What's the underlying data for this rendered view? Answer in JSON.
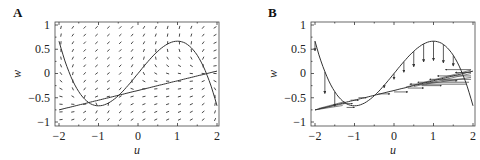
{
  "chart_data": [
    {
      "panel": "A",
      "type": "line",
      "description": "Phase plane with direction field (vector field arrows), cubic nullcline and linear nullcline",
      "xlabel": "u",
      "ylabel": "w",
      "xlim": [
        -2,
        2
      ],
      "ylim": [
        -1,
        1
      ],
      "xticks": [
        "-2",
        "-1",
        "0",
        "1",
        "2"
      ],
      "yticks": [
        "1",
        "0.5",
        "0",
        "-0.5",
        "-1"
      ],
      "series": [
        {
          "name": "cubic nullcline",
          "formula": "w = u - u^3/3",
          "x": [
            -2,
            -1.5,
            -1,
            -0.5,
            0,
            0.5,
            1,
            1.5,
            2
          ],
          "y": [
            0.67,
            -0.38,
            -0.67,
            -0.46,
            0,
            0.46,
            0.67,
            0.38,
            -0.67
          ]
        },
        {
          "name": "linear nullcline",
          "formula": "w = 0.2u - 0.35",
          "x": [
            -2,
            2
          ],
          "y": [
            -0.75,
            0.05
          ]
        }
      ],
      "vector_field": {
        "grid_u": 14,
        "grid_w": 13
      }
    },
    {
      "panel": "B",
      "type": "line",
      "description": "Nullclines with sample trajectory arrows",
      "xlabel": "u",
      "ylabel": "w",
      "xlim": [
        -2,
        2
      ],
      "ylim": [
        -1,
        1
      ],
      "xticks": [
        "-2",
        "-1",
        "0",
        "1",
        "2"
      ],
      "yticks": [
        "1",
        "0.5",
        "0",
        "-0.5",
        "-1"
      ],
      "series": [
        {
          "name": "cubic nullcline",
          "formula": "w = u - u^3/3",
          "x": [
            -2,
            -1.5,
            -1,
            -0.5,
            0,
            0.5,
            1,
            1.5,
            2
          ],
          "y": [
            0.67,
            -0.38,
            -0.67,
            -0.46,
            0,
            0.46,
            0.67,
            0.38,
            -0.67
          ]
        },
        {
          "name": "linear nullcline",
          "formula": "w = 0.2u - 0.35",
          "x": [
            -2,
            2
          ],
          "y": [
            -0.75,
            0.05
          ]
        }
      ]
    }
  ],
  "panels": {
    "a": {
      "label": "A",
      "xlabel": "u",
      "ylabel": "w"
    },
    "b": {
      "label": "B",
      "xlabel": "u",
      "ylabel": "w"
    }
  },
  "ticks": {
    "x": [
      "−2",
      "−1",
      "0",
      "1",
      "2"
    ],
    "y": [
      "1",
      "0.5",
      "0",
      "−0.5",
      "−1"
    ]
  }
}
